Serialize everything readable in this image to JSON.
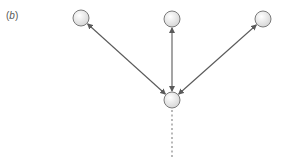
{
  "panel": {
    "label_open": "(",
    "label_letter": "b",
    "label_close": ")"
  },
  "colors": {
    "edge": "#5a5a5a",
    "node_stroke": "#7a7a7a",
    "node_fill_light": "#ffffff",
    "node_fill_dark": "#d4d4d4",
    "dotted": "#8a8a8a"
  },
  "nodes": [
    {
      "id": "top-left",
      "cx": 81,
      "cy": 18,
      "r": 8
    },
    {
      "id": "top-center",
      "cx": 172,
      "cy": 19,
      "r": 8
    },
    {
      "id": "top-right",
      "cx": 263,
      "cy": 19,
      "r": 8
    },
    {
      "id": "bottom-center",
      "cx": 172,
      "cy": 100,
      "r": 8
    }
  ],
  "edges": [
    {
      "from": "bottom-center",
      "to": "top-left",
      "type": "double-arrow"
    },
    {
      "from": "bottom-center",
      "to": "top-center",
      "type": "double-arrow"
    },
    {
      "from": "bottom-center",
      "to": "top-right",
      "type": "double-arrow"
    }
  ],
  "tail": {
    "from": "bottom-center",
    "x": 172,
    "y1": 110,
    "y2": 157,
    "style": "dotted"
  }
}
